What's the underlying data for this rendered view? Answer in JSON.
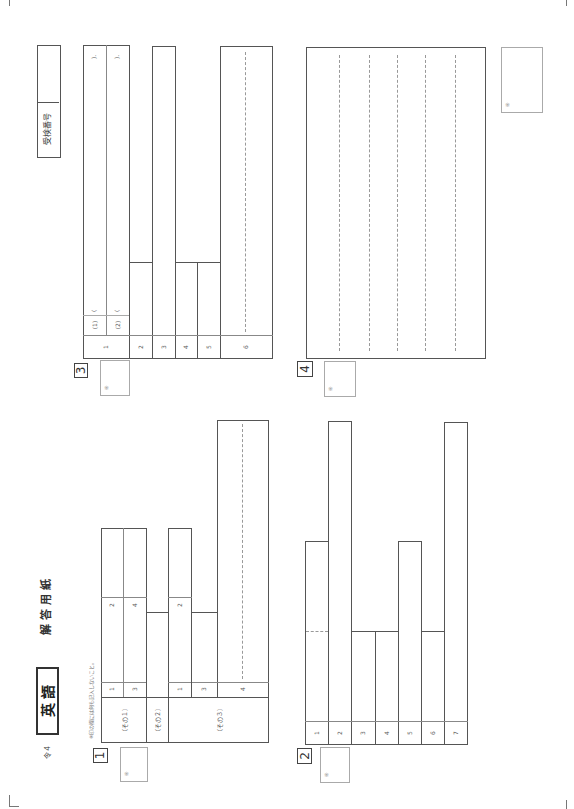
{
  "header": {
    "year": "令４",
    "subject": "英 語",
    "title": "解 答 用 紙",
    "note": "※印の欄には何も記入しないこと。",
    "exam_number_label": "受検番号",
    "exam_number_value": ""
  },
  "score_mark": "※",
  "sections": {
    "s1": {
      "label": "1",
      "parts": [
        "（その１）",
        "（その２）",
        "（その３）"
      ],
      "part1_items": [
        "1",
        "2",
        "3",
        "4"
      ],
      "part2_items": [
        "1",
        "2"
      ],
      "part3_items": [
        "3",
        "4"
      ]
    },
    "s2": {
      "label": "2",
      "items": [
        "1",
        "2",
        "3",
        "4",
        "5",
        "6",
        "7"
      ]
    },
    "s3": {
      "label": "3",
      "items": [
        "1",
        "2",
        "3",
        "4",
        "5",
        "6"
      ],
      "sub_items": [
        "(1)",
        "(2)"
      ],
      "paren_open": "(",
      "paren_close": ")."
    },
    "s4": {
      "label": "4",
      "lines": 5
    }
  }
}
